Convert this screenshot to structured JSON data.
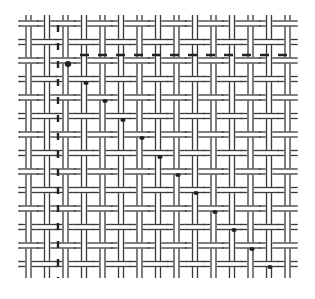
{
  "diagram": {
    "type": "basket-weave-pattern",
    "background": "#ffffff",
    "stroke_color": "#3a3a3a",
    "marker_color": "#222222",
    "bounds": {
      "x0": 20,
      "y0": 15,
      "x1": 294,
      "y1": 278
    },
    "pitch": 18.5,
    "strand_gap": 5,
    "columns": 15,
    "rows": 14,
    "dashed_row_y": 55,
    "dashed_col_x": 58,
    "diagonal_markers": [
      [
        68,
        64
      ],
      [
        86,
        83
      ],
      [
        105,
        101
      ],
      [
        123,
        120
      ],
      [
        142,
        138
      ],
      [
        160,
        157
      ],
      [
        178,
        175
      ],
      [
        196,
        193
      ],
      [
        215,
        212
      ],
      [
        234,
        230
      ],
      [
        252,
        249
      ],
      [
        270,
        267
      ]
    ]
  }
}
